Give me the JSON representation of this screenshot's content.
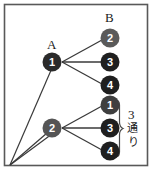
{
  "figure": {
    "frame_color": "#555555",
    "background": "#ffffff",
    "line_color": "#3a3a3a"
  },
  "labels": {
    "group_a": "A",
    "group_b": "B"
  },
  "nodes": {
    "left": [
      {
        "id": "a1",
        "number": "1",
        "fill": "#2b2b2b",
        "cx": 52,
        "cy": 62
      },
      {
        "id": "a2",
        "number": "2",
        "fill": "#555555",
        "cx": 52,
        "cy": 128
      }
    ],
    "right_upper": [
      {
        "id": "b2",
        "number": "2",
        "fill": "#5a5a5a",
        "cx": 110,
        "cy": 38
      },
      {
        "id": "b3",
        "number": "3",
        "fill": "#1f1f1f",
        "cx": 110,
        "cy": 62
      },
      {
        "id": "b4",
        "number": "4",
        "fill": "#1f1f1f",
        "cx": 110,
        "cy": 85
      }
    ],
    "right_lower": [
      {
        "id": "c1",
        "number": "1",
        "fill": "#3f3f3f",
        "cx": 110,
        "cy": 105
      },
      {
        "id": "c3",
        "number": "3",
        "fill": "#1f1f1f",
        "cx": 110,
        "cy": 128
      },
      {
        "id": "c4",
        "number": "4",
        "fill": "#1f1f1f",
        "cx": 110,
        "cy": 151
      }
    ]
  },
  "annotation": {
    "count": "3",
    "unit_line1": "通",
    "unit_line2": "り",
    "full_text": "3通り"
  }
}
